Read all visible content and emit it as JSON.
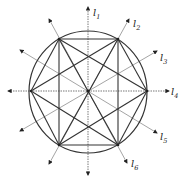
{
  "diagram": {
    "type": "geometric-construction",
    "center": [
      88,
      91
    ],
    "circle": {
      "cx": 88,
      "cy": 92,
      "rx": 59,
      "ry": 61
    },
    "vertices": {
      "L": [
        31,
        91
      ],
      "R": [
        147,
        91
      ],
      "TL": [
        59,
        39
      ],
      "TR": [
        118,
        39
      ],
      "BL": [
        59,
        145
      ],
      "BR": [
        118,
        145
      ]
    },
    "chords": [
      [
        "TL",
        "TR"
      ],
      [
        "TR",
        "BR"
      ],
      [
        "BR",
        "BL"
      ],
      [
        "BL",
        "TL"
      ],
      [
        "L",
        "TL"
      ],
      [
        "L",
        "BL"
      ],
      [
        "R",
        "TR"
      ],
      [
        "R",
        "BR"
      ],
      [
        "L",
        "TR"
      ],
      [
        "L",
        "BR"
      ],
      [
        "R",
        "TL"
      ],
      [
        "R",
        "BL"
      ],
      [
        "TL",
        "BR"
      ],
      [
        "TR",
        "BL"
      ]
    ],
    "lines": [
      {
        "id": "l1",
        "label": "l",
        "sub": "1",
        "from": [
          88,
          175
        ],
        "to": [
          88,
          7
        ],
        "dashed": true,
        "label_pos": [
          93,
          16
        ]
      },
      {
        "id": "l2",
        "label": "l",
        "sub": "2",
        "from": [
          49,
          164
        ],
        "to": [
          129,
          19
        ],
        "dashed": false,
        "label_pos": [
          133,
          27
        ]
      },
      {
        "id": "l3",
        "label": "l",
        "sub": "3",
        "from": [
          20,
          131
        ],
        "to": [
          157,
          51
        ],
        "dashed": false,
        "label_pos": [
          160,
          61
        ]
      },
      {
        "id": "l4",
        "label": "l",
        "sub": "4",
        "from": [
          8,
          91
        ],
        "to": [
          169,
          91
        ],
        "dashed": true,
        "label_pos": [
          171,
          95
        ]
      },
      {
        "id": "l5",
        "label": "l",
        "sub": "5",
        "from": [
          20,
          50
        ],
        "to": [
          157,
          133
        ],
        "dashed": false,
        "label_pos": [
          160,
          140
        ]
      },
      {
        "id": "l6",
        "label": "l",
        "sub": "6",
        "from": [
          49,
          19
        ],
        "to": [
          127,
          163
        ],
        "dashed": false,
        "label_pos": [
          131,
          167
        ]
      }
    ],
    "extra_arrowheads": [
      {
        "line": "l1",
        "at": [
          88,
          175
        ]
      },
      {
        "line": "l2",
        "at": [
          49,
          164
        ]
      },
      {
        "line": "l3",
        "at": [
          20,
          131
        ]
      },
      {
        "line": "l4",
        "at": [
          8,
          91
        ]
      },
      {
        "line": "l5",
        "at": [
          20,
          50
        ]
      },
      {
        "line": "l6",
        "at": [
          49,
          19
        ]
      }
    ],
    "colors": {
      "chord": "#333333",
      "axis": "#9a9a9a",
      "axis_dashed": "#6a6a6a",
      "label": "#222222"
    }
  }
}
